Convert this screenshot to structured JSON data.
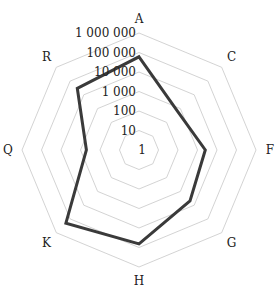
{
  "chart_data": {
    "type": "radar",
    "title": "",
    "scale": "log10",
    "axes": [
      "A",
      "C",
      "F",
      "G",
      "H",
      "K",
      "Q",
      "R"
    ],
    "radial_ticks": [
      "1",
      "10",
      "100",
      "1 000",
      "10 000",
      "100 000",
      "1 000 000"
    ],
    "radial_range": [
      1,
      1000000
    ],
    "grid": true,
    "legend": null,
    "series": [
      {
        "name": "series-1",
        "color": "#3a3a3a",
        "values": [
          60000,
          630,
          2500,
          5000,
          65000,
          200000,
          500,
          30000
        ]
      }
    ]
  }
}
